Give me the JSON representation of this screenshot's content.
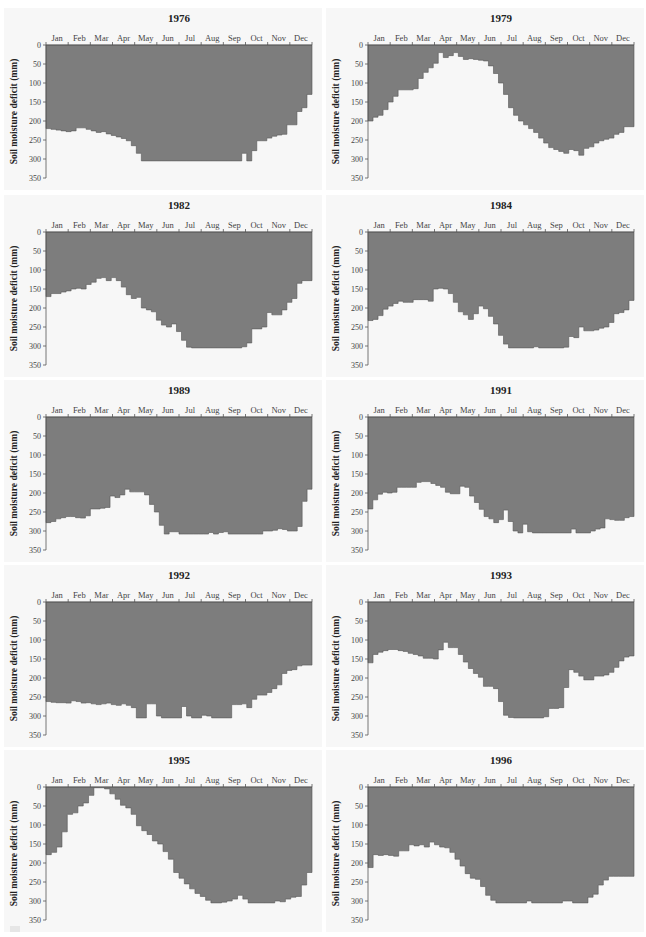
{
  "figure": {
    "ylabel": "Soil moisture deficit (mm)",
    "months": [
      "Jan",
      "Feb",
      "Mar",
      "Apr",
      "May",
      "Jun",
      "Jul",
      "Aug",
      "Sep",
      "Oct",
      "Nov",
      "Dec"
    ],
    "yticks": [
      0,
      50,
      100,
      150,
      200,
      250,
      300,
      350
    ],
    "fill_color": "#7d7d7d",
    "panel_background": "#f7f7f7"
  },
  "chart_data": [
    {
      "type": "area",
      "title": "1976",
      "xlabel": "",
      "ylabel": "Soil moisture deficit (mm)",
      "ylim": [
        350,
        0
      ],
      "x_categories": [
        "Jan",
        "Feb",
        "Mar",
        "Apr",
        "May",
        "Jun",
        "Jul",
        "Aug",
        "Sep",
        "Oct",
        "Nov",
        "Dec"
      ],
      "step_values": [
        220,
        222,
        224,
        226,
        228,
        226,
        218,
        218,
        222,
        226,
        230,
        228,
        234,
        238,
        242,
        246,
        252,
        265,
        285,
        305,
        305,
        305,
        305,
        305,
        305,
        305,
        305,
        305,
        305,
        305,
        305,
        305,
        305,
        305,
        305,
        305,
        305,
        305,
        305,
        285,
        305,
        278,
        252,
        252,
        245,
        240,
        237,
        235,
        210,
        210,
        175,
        165,
        130
      ]
    },
    {
      "type": "area",
      "title": "1979",
      "xlabel": "",
      "ylabel": "Soil moisture deficit (mm)",
      "ylim": [
        350,
        0
      ],
      "x_categories": [
        "Jan",
        "Feb",
        "Mar",
        "Apr",
        "May",
        "Jun",
        "Jul",
        "Aug",
        "Sep",
        "Oct",
        "Nov",
        "Dec"
      ],
      "step_values": [
        200,
        190,
        185,
        170,
        150,
        135,
        118,
        118,
        118,
        115,
        88,
        72,
        60,
        48,
        20,
        33,
        28,
        20,
        30,
        38,
        36,
        38,
        40,
        42,
        55,
        75,
        100,
        130,
        165,
        185,
        200,
        210,
        220,
        230,
        245,
        258,
        270,
        275,
        280,
        285,
        275,
        278,
        290,
        272,
        268,
        258,
        252,
        248,
        245,
        235,
        230,
        215,
        215
      ]
    },
    {
      "type": "area",
      "title": "1982",
      "xlabel": "",
      "ylabel": "Soil moisture deficit (mm)",
      "ylim": [
        350,
        0
      ],
      "x_categories": [
        "Jan",
        "Feb",
        "Mar",
        "Apr",
        "May",
        "Jun",
        "Jul",
        "Aug",
        "Sep",
        "Oct",
        "Nov",
        "Dec"
      ],
      "step_values": [
        170,
        162,
        162,
        158,
        155,
        150,
        148,
        150,
        138,
        132,
        122,
        120,
        128,
        120,
        128,
        145,
        165,
        175,
        172,
        200,
        205,
        210,
        232,
        245,
        250,
        242,
        262,
        285,
        303,
        305,
        305,
        305,
        305,
        305,
        305,
        305,
        305,
        305,
        305,
        302,
        292,
        255,
        255,
        250,
        212,
        218,
        218,
        205,
        185,
        175,
        135,
        128,
        128
      ]
    },
    {
      "type": "area",
      "title": "1984",
      "xlabel": "",
      "ylabel": "Soil moisture deficit (mm)",
      "ylim": [
        350,
        0
      ],
      "x_categories": [
        "Jan",
        "Feb",
        "Mar",
        "Apr",
        "May",
        "Jun",
        "Jul",
        "Aug",
        "Sep",
        "Oct",
        "Nov",
        "Dec"
      ],
      "step_values": [
        233,
        230,
        220,
        203,
        195,
        188,
        182,
        185,
        185,
        178,
        178,
        178,
        182,
        150,
        148,
        150,
        162,
        185,
        210,
        218,
        230,
        215,
        195,
        202,
        222,
        242,
        272,
        295,
        305,
        305,
        305,
        305,
        305,
        302,
        305,
        305,
        305,
        305,
        305,
        303,
        275,
        278,
        250,
        260,
        260,
        258,
        253,
        250,
        238,
        215,
        212,
        205,
        180
      ]
    },
    {
      "type": "area",
      "title": "1989",
      "xlabel": "",
      "ylabel": "Soil moisture deficit (mm)",
      "ylim": [
        350,
        0
      ],
      "x_categories": [
        "Jan",
        "Feb",
        "Mar",
        "Apr",
        "May",
        "Jun",
        "Jul",
        "Aug",
        "Sep",
        "Oct",
        "Nov",
        "Dec"
      ],
      "step_values": [
        278,
        275,
        268,
        265,
        262,
        262,
        265,
        266,
        260,
        242,
        242,
        240,
        238,
        208,
        212,
        205,
        190,
        197,
        197,
        197,
        205,
        230,
        250,
        285,
        308,
        302,
        302,
        308,
        308,
        308,
        308,
        308,
        308,
        304,
        308,
        304,
        302,
        308,
        308,
        308,
        308,
        308,
        308,
        308,
        300,
        300,
        298,
        294,
        296,
        300,
        300,
        288,
        222,
        190
      ]
    },
    {
      "type": "area",
      "title": "1991",
      "xlabel": "",
      "ylabel": "Soil moisture deficit (mm)",
      "ylim": [
        350,
        0
      ],
      "x_categories": [
        "Jan",
        "Feb",
        "Mar",
        "Apr",
        "May",
        "Jun",
        "Jul",
        "Aug",
        "Sep",
        "Oct",
        "Nov",
        "Dec"
      ],
      "step_values": [
        242,
        218,
        203,
        198,
        200,
        198,
        185,
        185,
        185,
        185,
        172,
        170,
        170,
        175,
        180,
        185,
        198,
        202,
        202,
        182,
        185,
        208,
        225,
        243,
        262,
        268,
        278,
        270,
        245,
        275,
        300,
        305,
        282,
        302,
        305,
        305,
        305,
        305,
        305,
        305,
        305,
        305,
        295,
        305,
        305,
        305,
        300,
        295,
        292,
        268,
        270,
        272,
        272,
        265,
        262
      ]
    },
    {
      "type": "area",
      "title": "1992",
      "xlabel": "",
      "ylabel": "Soil moisture deficit (mm)",
      "ylim": [
        350,
        0
      ],
      "x_categories": [
        "Jan",
        "Feb",
        "Mar",
        "Apr",
        "May",
        "Jun",
        "Jul",
        "Aug",
        "Sep",
        "Oct",
        "Nov",
        "Dec"
      ],
      "step_values": [
        262,
        264,
        265,
        265,
        266,
        260,
        262,
        266,
        265,
        268,
        270,
        268,
        266,
        270,
        272,
        268,
        272,
        278,
        305,
        305,
        268,
        268,
        300,
        305,
        305,
        305,
        305,
        275,
        300,
        305,
        305,
        298,
        300,
        305,
        305,
        305,
        305,
        270,
        270,
        268,
        278,
        256,
        245,
        245,
        238,
        228,
        218,
        188,
        180,
        178,
        168,
        166,
        166
      ]
    },
    {
      "type": "area",
      "title": "1993",
      "xlabel": "",
      "ylabel": "Soil moisture deficit (mm)",
      "ylim": [
        350,
        0
      ],
      "x_categories": [
        "Jan",
        "Feb",
        "Mar",
        "Apr",
        "May",
        "Jun",
        "Jul",
        "Aug",
        "Sep",
        "Oct",
        "Nov",
        "Dec"
      ],
      "step_values": [
        160,
        138,
        132,
        128,
        125,
        125,
        128,
        130,
        135,
        138,
        142,
        148,
        148,
        150,
        126,
        106,
        120,
        120,
        138,
        158,
        175,
        188,
        198,
        222,
        222,
        228,
        262,
        298,
        304,
        305,
        305,
        305,
        305,
        305,
        305,
        302,
        280,
        280,
        278,
        225,
        178,
        185,
        195,
        205,
        205,
        195,
        195,
        192,
        185,
        172,
        155,
        145,
        142
      ]
    },
    {
      "type": "area",
      "title": "1995",
      "xlabel": "",
      "ylabel": "Soil moisture deficit (mm)",
      "ylim": [
        350,
        0
      ],
      "x_categories": [
        "Jan",
        "Feb",
        "Mar",
        "Apr",
        "May",
        "Jun",
        "Jul",
        "Aug",
        "Sep",
        "Oct",
        "Nov",
        "Dec"
      ],
      "step_values": [
        178,
        172,
        158,
        118,
        72,
        68,
        50,
        42,
        22,
        2,
        2,
        5,
        18,
        32,
        48,
        55,
        72,
        102,
        115,
        125,
        142,
        150,
        170,
        190,
        225,
        240,
        255,
        268,
        280,
        288,
        298,
        305,
        305,
        303,
        300,
        295,
        285,
        295,
        305,
        305,
        305,
        305,
        305,
        300,
        302,
        295,
        290,
        288,
        258,
        225
      ]
    },
    {
      "type": "area",
      "title": "1996",
      "xlabel": "",
      "ylabel": "Soil moisture deficit (mm)",
      "ylim": [
        350,
        0
      ],
      "x_categories": [
        "Jan",
        "Feb",
        "Mar",
        "Apr",
        "May",
        "Jun",
        "Jul",
        "Aug",
        "Sep",
        "Oct",
        "Nov",
        "Dec"
      ],
      "step_values": [
        212,
        178,
        180,
        178,
        180,
        182,
        168,
        168,
        152,
        155,
        152,
        158,
        145,
        152,
        158,
        160,
        172,
        190,
        208,
        228,
        240,
        243,
        262,
        285,
        298,
        305,
        305,
        305,
        305,
        305,
        305,
        300,
        305,
        305,
        305,
        305,
        305,
        305,
        300,
        300,
        305,
        305,
        305,
        290,
        282,
        258,
        245,
        235,
        235,
        235,
        235,
        235
      ]
    }
  ]
}
